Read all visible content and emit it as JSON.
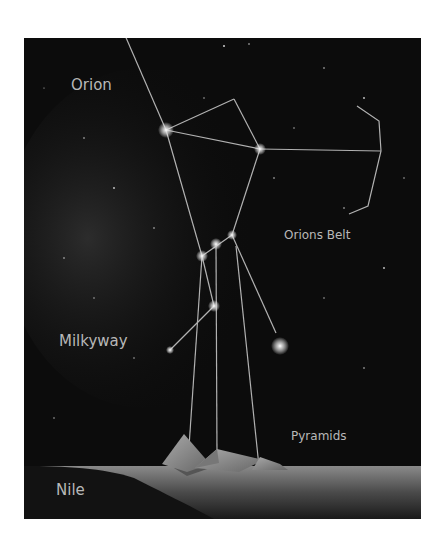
{
  "diagram": {
    "labels": {
      "orion": "Orion",
      "orions_belt": "Orions Belt",
      "milkyway": "Milkyway",
      "pyramids": "Pyramids",
      "nile": "Nile"
    },
    "colors": {
      "background": "#0c0c0c",
      "line": "#d0d0d0",
      "text": "#b8b8b8",
      "ground": "#6a6a6a"
    }
  }
}
